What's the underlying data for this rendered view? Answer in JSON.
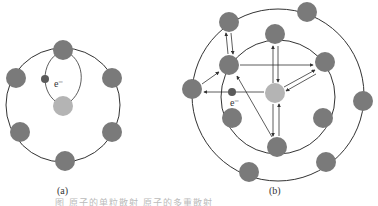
{
  "figure": {
    "panel_a": {
      "label": "(a)",
      "electron_label": "e⁻",
      "orbit": {
        "cx": 63,
        "cy": 105,
        "r": 57
      },
      "atoms": [
        {
          "x": 63,
          "y": 50
        },
        {
          "x": 16,
          "y": 78
        },
        {
          "x": 112,
          "y": 78
        },
        {
          "x": 20,
          "y": 132
        },
        {
          "x": 112,
          "y": 132
        },
        {
          "x": 65,
          "y": 161
        }
      ],
      "center_atom": {
        "x": 63,
        "y": 106
      },
      "electron": {
        "x": 45,
        "y": 79
      }
    },
    "panel_b": {
      "label": "(b)",
      "electron_label": "e⁻",
      "inner_orbit": {
        "cx": 278,
        "cy": 97,
        "r": 57
      },
      "outer_orbit": {
        "cx": 278,
        "cy": 95,
        "r": 86
      },
      "inner_atoms": [
        {
          "x": 275,
          "y": 34
        },
        {
          "x": 325,
          "y": 62
        },
        {
          "x": 229,
          "y": 65
        },
        {
          "x": 232,
          "y": 118
        },
        {
          "x": 323,
          "y": 118
        },
        {
          "x": 277,
          "y": 147
        }
      ],
      "outer_atoms": [
        {
          "x": 229,
          "y": 22
        },
        {
          "x": 307,
          "y": 12
        },
        {
          "x": 192,
          "y": 89
        },
        {
          "x": 363,
          "y": 101
        },
        {
          "x": 249,
          "y": 172
        },
        {
          "x": 326,
          "y": 162
        }
      ],
      "center_atom": {
        "x": 275,
        "y": 93
      },
      "electron": {
        "x": 232,
        "y": 92
      }
    },
    "caption": "图          原子的单粒散射      原子的多重散射",
    "colors": {
      "atom": "#7a7a7a",
      "center_atom": "#b4b4b4",
      "electron": "#5a5a5a",
      "line": "#333333"
    }
  }
}
